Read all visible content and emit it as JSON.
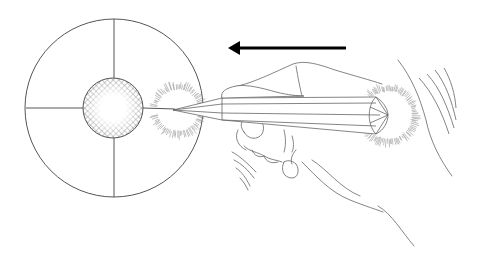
{
  "figure": {
    "width": 479,
    "height": 263,
    "background": "#ffffff",
    "line_color": "#555555",
    "ink_color": "#000000",
    "hatch_color": "#666666",
    "fuzz_color": "#888888",
    "elements": {
      "target_circle": {
        "cx": 114,
        "cy": 108,
        "r": 89
      },
      "crosshair": true,
      "center_disc": {
        "cx": 113,
        "cy": 108,
        "r": 30,
        "fill": "crosshatch-with-white-center"
      },
      "fuzzy_ring_front": {
        "cx": 178,
        "cy": 110,
        "r": 22
      },
      "fuzzy_ring_back": {
        "cx": 388,
        "cy": 115,
        "r": 25
      },
      "direction_arrow": {
        "x1": 346,
        "y1": 48,
        "x2": 228,
        "y2": 48,
        "direction": "left"
      },
      "instrument": {
        "tip": [
          173,
          110
        ],
        "end": [
          388,
          115
        ]
      },
      "hand": "outline holding instrument",
      "motion_lines": 4
    }
  }
}
